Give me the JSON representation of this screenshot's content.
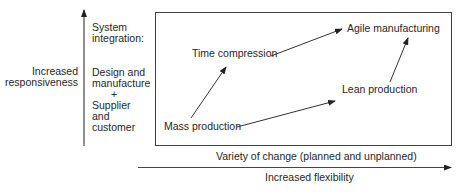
{
  "diagram": {
    "y_axis": {
      "label_lines": [
        "Increased",
        "responsiveness"
      ],
      "annotation": {
        "heading_lines": [
          "System",
          "integration:"
        ],
        "body_lines": [
          "Design and",
          "manufacture",
          "+",
          "Supplier",
          "and",
          "customer"
        ]
      }
    },
    "x_axis": {
      "inner_label": "Variety of change (planned and unplanned)",
      "label": "Increased flexibility"
    },
    "nodes": {
      "mass": "Mass production",
      "time": "Time compression",
      "lean": "Lean production",
      "agile": "Agile manufacturing"
    },
    "edges": [
      {
        "from": "Mass production",
        "to": "Time compression"
      },
      {
        "from": "Mass production",
        "to": "Lean production"
      },
      {
        "from": "Time compression",
        "to": "Agile manufacturing"
      },
      {
        "from": "Lean production",
        "to": "Agile manufacturing"
      }
    ],
    "colors": {
      "line": "#333333",
      "text": "#262626",
      "background": "#ffffff"
    }
  }
}
